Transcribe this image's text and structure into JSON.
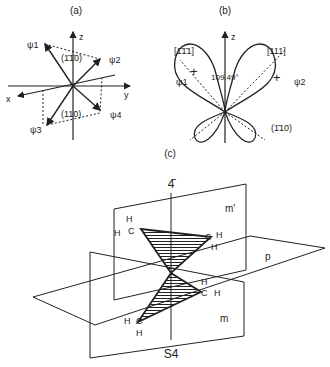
{
  "panels": {
    "a": {
      "label": "(a)",
      "axes": {
        "x": "x",
        "y": "y",
        "z": "z"
      },
      "vectors": [
        "ψ1",
        "ψ2",
        "ψ3",
        "ψ4"
      ],
      "planes": [
        "(1̄1̄0)",
        "(110)"
      ]
    },
    "b": {
      "label": "(b)",
      "axis": "z",
      "directions": [
        "[1̄1̄1]",
        "[111]"
      ],
      "angle": "109.49°",
      "orbitals": [
        "ψ1",
        "ψ2"
      ],
      "plane": "(1̄10)"
    },
    "c": {
      "label": "(c)",
      "top_axis": "4̄",
      "bottom_axis": "S4",
      "planes": [
        "m'",
        "p",
        "m"
      ],
      "atoms": {
        "carbon": "C",
        "hydrogen": "H"
      }
    }
  },
  "colors": {
    "line": "#222222",
    "background": "#ffffff"
  }
}
